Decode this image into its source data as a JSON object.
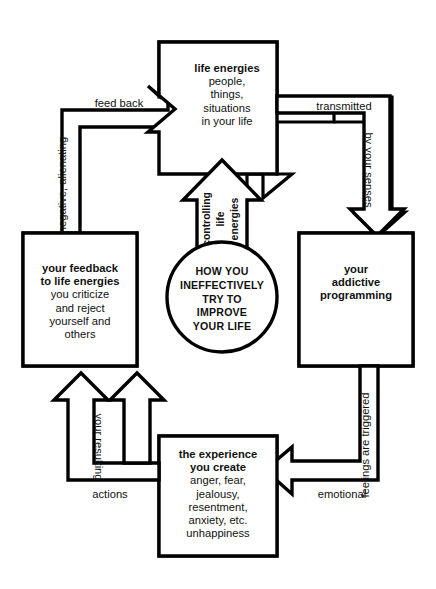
{
  "diagram": {
    "title": "How you ineffectively try to improve your life",
    "type": "cycle-flow-diagram",
    "stroke_color": "#000000",
    "fill_color": "#ffffff",
    "center": {
      "circle_text_lines": [
        "HOW YOU",
        "INEFFECTIVELY",
        "TRY TO",
        "IMPROVE",
        "YOUR LIFE"
      ],
      "arrow_label_lines": [
        "controlling",
        "life",
        "energies"
      ]
    },
    "nodes": [
      {
        "id": "life-energies",
        "position": "top",
        "heading": "life energies",
        "body_lines": [
          "people,",
          "things,",
          "situations",
          "in your life"
        ]
      },
      {
        "id": "addictive-programming",
        "position": "right",
        "heading_lines": [
          "your",
          "addictive",
          "programming"
        ],
        "body_lines": []
      },
      {
        "id": "the-experience-you-create",
        "position": "bottom",
        "heading_lines": [
          "the experience",
          "you create"
        ],
        "body_lines": [
          "anger, fear,",
          "jealousy,",
          "resentment,",
          "anxiety, etc.",
          "unhappiness"
        ]
      },
      {
        "id": "your-feedback",
        "position": "left",
        "heading_lines": [
          "your feedback",
          "to life energies"
        ],
        "body_lines": [
          "you criticize",
          "and reject",
          "yourself and",
          "others"
        ]
      }
    ],
    "edges": [
      {
        "id": "top-to-right",
        "from": "life-energies",
        "to": "addictive-programming",
        "label_h": "transmitted",
        "label_v": "by your senses",
        "v_rotation": "cw"
      },
      {
        "id": "right-to-bottom",
        "from": "addictive-programming",
        "to": "the-experience-you-create",
        "label_h": "emotional",
        "label_v": "feelings are triggered",
        "v_rotation": "ccw"
      },
      {
        "id": "bottom-to-left",
        "from": "the-experience-you-create",
        "to": "your-feedback",
        "label_h": "actions",
        "label_v": "your resulting",
        "v_rotation": "cw"
      },
      {
        "id": "left-to-top",
        "from": "your-feedback",
        "to": "life-energies",
        "label_h": "feed back",
        "label_v": "negative, alienating",
        "v_rotation": "ccw"
      }
    ]
  }
}
